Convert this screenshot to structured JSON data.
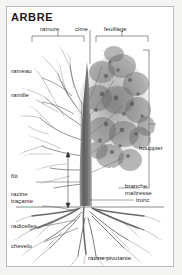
{
  "figure": {
    "title": "ARBRE",
    "language": "fr",
    "kind": "botanical-diagram",
    "border_color": "#b9b9b9",
    "background_color": "#ffffff",
    "ink_color": "#2b2b2b"
  },
  "brackets": [
    {
      "id": "ramure",
      "label": "ramure",
      "side": "top"
    },
    {
      "id": "cime",
      "label": "cime",
      "side": "top"
    },
    {
      "id": "feuillage",
      "label": "feuillage",
      "side": "top"
    },
    {
      "id": "houppier",
      "label": "houppier",
      "side": "right"
    }
  ],
  "labels": {
    "ramure": "ramure",
    "cime": "cime",
    "feuillage": "feuillage",
    "rameau": "rameau",
    "ramille": "ramille",
    "houppier": "houppier",
    "branche_maitresse_line1": "branche",
    "branche_maitresse_line2": "maîtresse",
    "tronc": "tronc",
    "fut": "fût",
    "racine_tracante_line1": "racine",
    "racine_tracante_line2": "traçante",
    "radicelles": "radicelles",
    "chevelu": "chevelu",
    "racine_pivotante": "racine pivotante"
  }
}
